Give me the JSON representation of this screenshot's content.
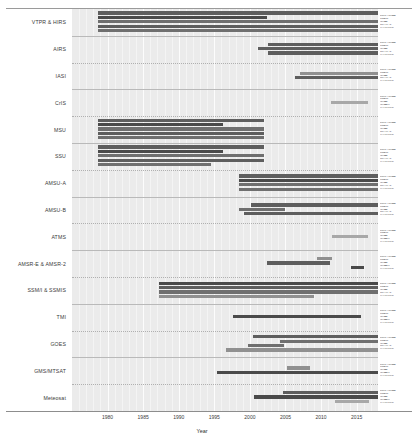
{
  "figure": {
    "axis": {
      "xlabel": "Year",
      "xmin": 1975.0,
      "xmax": 2018.0
    },
    "ticks": [
      "1980",
      "1985",
      "1990",
      "1995",
      "2000",
      "2005",
      "2010",
      "2015"
    ],
    "tick_values": [
      1980,
      1985,
      1990,
      1995,
      2000,
      2005,
      2010,
      2015
    ],
    "colors": {
      "panel_bg": "#ebebeb",
      "gridline": "#ffffff",
      "bar_darkest": "#4a4a4a",
      "bar_dark": "#5e5e5e",
      "bar_mid": "#6f6f6f",
      "bar_light": "#909090",
      "bar_lightest": "#a8a8a8",
      "axis": "#8d8d8d",
      "text": "#3a3a3a"
    }
  },
  "chart_data": {
    "type": "bar",
    "title": "",
    "xlabel": "Year",
    "ylabel": "",
    "xlim": [
      1975.0,
      2018.0
    ],
    "grid": "vertical-white",
    "legend": "right-side per-row satellite labels",
    "orientation": "horizontal-gantt",
    "categories": [
      "VTPR & HIRS",
      "AIRS",
      "IASI",
      "CrIS",
      "MSU",
      "SSU",
      "AMSU-A",
      "AMSU-B",
      "ATMS",
      "AMSR-E & AMSR-2",
      "SSM/I & SSMIS",
      "TMI",
      "GOES",
      "GMS/MTSAT",
      "Meteosat"
    ],
    "rows": [
      {
        "category": "VTPR & HIRS",
        "right_labels": [
          "DMSP/NOAA",
          "JMA-M",
          "NOAA",
          "METOP-2",
          "OTHER/Eur"
        ],
        "bars": [
          {
            "start": 1978.6,
            "end": 2018.0,
            "shade": "bar_dark"
          },
          {
            "start": 1978.6,
            "end": 2002.4,
            "shade": "bar_darkest"
          },
          {
            "start": 1978.6,
            "end": 2018.0,
            "shade": "bar_mid"
          },
          {
            "start": 1978.6,
            "end": 2018.0,
            "shade": "bar_dark"
          },
          {
            "start": 1978.6,
            "end": 2018.0,
            "shade": "bar_mid"
          }
        ]
      },
      {
        "category": "AIRS",
        "right_labels": [
          "DMSP/NOAA",
          "JMA-M",
          "NOAA",
          "METOP-2",
          "OTHER/Eur"
        ],
        "bars": [
          {
            "start": 2002.6,
            "end": 2018.0,
            "shade": "bar_dark"
          },
          {
            "start": 2001.1,
            "end": 2018.0,
            "shade": "bar_dark"
          },
          {
            "start": 2002.6,
            "end": 2018.0,
            "shade": "bar_dark"
          }
        ]
      },
      {
        "category": "IASI",
        "right_labels": [
          "DMSP/NOAA",
          "JMA-M",
          "NOAA",
          "METOP-2",
          "OTHER/Eur"
        ],
        "bars": [
          {
            "start": 2007.1,
            "end": 2018.0,
            "shade": "bar_light"
          },
          {
            "start": 2006.4,
            "end": 2018.0,
            "shade": "bar_dark"
          }
        ]
      },
      {
        "category": "CrIS",
        "right_labels": [
          "DMSP/NOAA",
          "JMA-M",
          "NOAA",
          "NOAA-J",
          "OTHER/Eur"
        ],
        "bars": [
          {
            "start": 2011.4,
            "end": 2016.6,
            "shade": "bar_lightest"
          }
        ]
      },
      {
        "category": "MSU",
        "right_labels": [
          "DMSP/NOAA",
          "JMA-M",
          "NOAA",
          "METOP-2",
          "OTHER/Eur"
        ],
        "bars": [
          {
            "start": 1978.6,
            "end": 2002.0,
            "shade": "bar_dark"
          },
          {
            "start": 1978.6,
            "end": 1996.2,
            "shade": "bar_darkest"
          },
          {
            "start": 1978.6,
            "end": 2002.0,
            "shade": "bar_mid"
          },
          {
            "start": 1978.6,
            "end": 2002.0,
            "shade": "bar_dark"
          },
          {
            "start": 1978.6,
            "end": 2002.0,
            "shade": "bar_mid"
          }
        ]
      },
      {
        "category": "SSU",
        "right_labels": [
          "DMSP/NOAA",
          "JMA-M",
          "NOAA",
          "METOP-2",
          "OTHER/Eur"
        ],
        "bars": [
          {
            "start": 1978.6,
            "end": 2002.0,
            "shade": "bar_dark"
          },
          {
            "start": 1978.6,
            "end": 1996.2,
            "shade": "bar_darkest"
          },
          {
            "start": 1978.6,
            "end": 2002.0,
            "shade": "bar_mid"
          },
          {
            "start": 1978.6,
            "end": 2002.0,
            "shade": "bar_dark"
          },
          {
            "start": 1978.6,
            "end": 1994.6,
            "shade": "bar_mid"
          }
        ]
      },
      {
        "category": "AMSU-A",
        "right_labels": [
          "DMSP/NOAA",
          "JMA-M",
          "NOAA",
          "METOP-2",
          "OTHER/Eur"
        ],
        "bars": [
          {
            "start": 1998.4,
            "end": 2018.0,
            "shade": "bar_dark"
          },
          {
            "start": 1998.4,
            "end": 2018.0,
            "shade": "bar_darkest"
          },
          {
            "start": 1998.4,
            "end": 2018.0,
            "shade": "bar_mid"
          },
          {
            "start": 1998.4,
            "end": 2018.0,
            "shade": "bar_mid"
          }
        ]
      },
      {
        "category": "AMSU-B",
        "right_labels": [
          "DMSP/NOAA",
          "JMA-M",
          "NOAA",
          "METOP-2",
          "OTHER/Eur"
        ],
        "bars": [
          {
            "start": 2000.2,
            "end": 2018.0,
            "shade": "bar_dark"
          },
          {
            "start": 1998.4,
            "end": 2005.0,
            "shade": "bar_mid"
          },
          {
            "start": 1999.2,
            "end": 2018.0,
            "shade": "bar_dark"
          }
        ]
      },
      {
        "category": "ATMS",
        "right_labels": [
          "DMSP/NOAA",
          "JMA-M",
          "NOAA",
          "NOAA-J",
          "OTHER/Eur"
        ],
        "bars": [
          {
            "start": 2011.6,
            "end": 2016.6,
            "shade": "bar_lightest"
          }
        ]
      },
      {
        "category": "AMSR-E & AMSR-2",
        "right_labels": [
          "DMSP/NOAA",
          "JMA-M",
          "NOAA",
          "NOAA-J",
          "OTHER/Eur"
        ],
        "bars": [
          {
            "start": 2009.4,
            "end": 2011.6,
            "shade": "bar_light"
          },
          {
            "start": 2002.4,
            "end": 2011.2,
            "shade": "bar_dark"
          },
          {
            "start": 2014.2,
            "end": 2016.0,
            "shade": "bar_darkest"
          }
        ]
      },
      {
        "category": "SSM/I & SSMIS",
        "right_labels": [
          "DMSP/NOAA",
          "JMA-M",
          "NOAA",
          "METOP-2",
          "OTHER/Eur"
        ],
        "bars": [
          {
            "start": 1987.2,
            "end": 2018.0,
            "shade": "bar_darkest"
          },
          {
            "start": 1987.2,
            "end": 2018.0,
            "shade": "bar_dark"
          },
          {
            "start": 1987.2,
            "end": 2018.0,
            "shade": "bar_mid"
          },
          {
            "start": 1987.2,
            "end": 2009.0,
            "shade": "bar_light"
          }
        ]
      },
      {
        "category": "TMI",
        "right_labels": [
          "DMSP/NOAA",
          "JMA-M",
          "NOAA",
          "NOAA-J",
          "OTHER/Eur"
        ],
        "bars": [
          {
            "start": 1997.6,
            "end": 2015.6,
            "shade": "bar_darkest"
          }
        ]
      },
      {
        "category": "GOES",
        "right_labels": [
          "DMSP/NOAA",
          "JMA-M",
          "NOAA",
          "METOP-2",
          "OTHER/Eur"
        ],
        "bars": [
          {
            "start": 2000.4,
            "end": 2018.0,
            "shade": "bar_dark"
          },
          {
            "start": 2004.2,
            "end": 2018.0,
            "shade": "bar_mid"
          },
          {
            "start": 1999.8,
            "end": 2004.8,
            "shade": "bar_mid"
          },
          {
            "start": 1996.6,
            "end": 2018.0,
            "shade": "bar_light"
          }
        ]
      },
      {
        "category": "GMS/MTSAT",
        "right_labels": [
          "DMSP/NOAA",
          "JMA-M",
          "NOAA",
          "NOAA-J",
          "OTHER/Eur"
        ],
        "bars": [
          {
            "start": 2005.2,
            "end": 2008.4,
            "shade": "bar_light"
          },
          {
            "start": 1995.4,
            "end": 2018.0,
            "shade": "bar_darkest"
          }
        ]
      },
      {
        "category": "Meteosat",
        "right_labels": [
          "DMSP/NOAA",
          "JMA-M",
          "NOAA",
          "NOAA-J",
          "OTHER/Eur"
        ],
        "bars": [
          {
            "start": 2004.6,
            "end": 2018.0,
            "shade": "bar_dark"
          },
          {
            "start": 2000.6,
            "end": 2018.0,
            "shade": "bar_darkest"
          },
          {
            "start": 2012.0,
            "end": 2016.8,
            "shade": "bar_lightest"
          }
        ]
      }
    ]
  }
}
